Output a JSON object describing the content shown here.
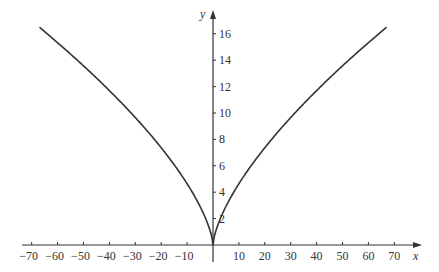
{
  "chart_data": {
    "type": "line",
    "title": "",
    "xlabel": "x",
    "ylabel": "y",
    "xlim": [
      -75,
      75
    ],
    "ylim": [
      0,
      17.5
    ],
    "grid": false,
    "legend": null,
    "x_ticks": [
      -70,
      -60,
      -50,
      -40,
      -30,
      -20,
      -10,
      10,
      20,
      30,
      40,
      50,
      60,
      70
    ],
    "y_ticks": [
      2,
      4,
      6,
      8,
      10,
      12,
      14,
      16
    ],
    "series": [
      {
        "name": "y = |x|^(2/3)",
        "function": "abs(x)^(2/3)",
        "x": [
          -67,
          -64,
          -60,
          -50,
          -40,
          -30,
          -20,
          -10,
          -5,
          -1,
          0,
          1,
          5,
          10,
          20,
          30,
          40,
          50,
          60,
          64,
          67
        ],
        "values": [
          16.5,
          16.0,
          15.33,
          13.57,
          11.7,
          9.65,
          7.37,
          4.64,
          2.92,
          1.0,
          0,
          1.0,
          2.92,
          4.64,
          7.37,
          9.65,
          11.7,
          13.57,
          15.33,
          16.0,
          16.5
        ],
        "color": "#333333"
      }
    ]
  }
}
